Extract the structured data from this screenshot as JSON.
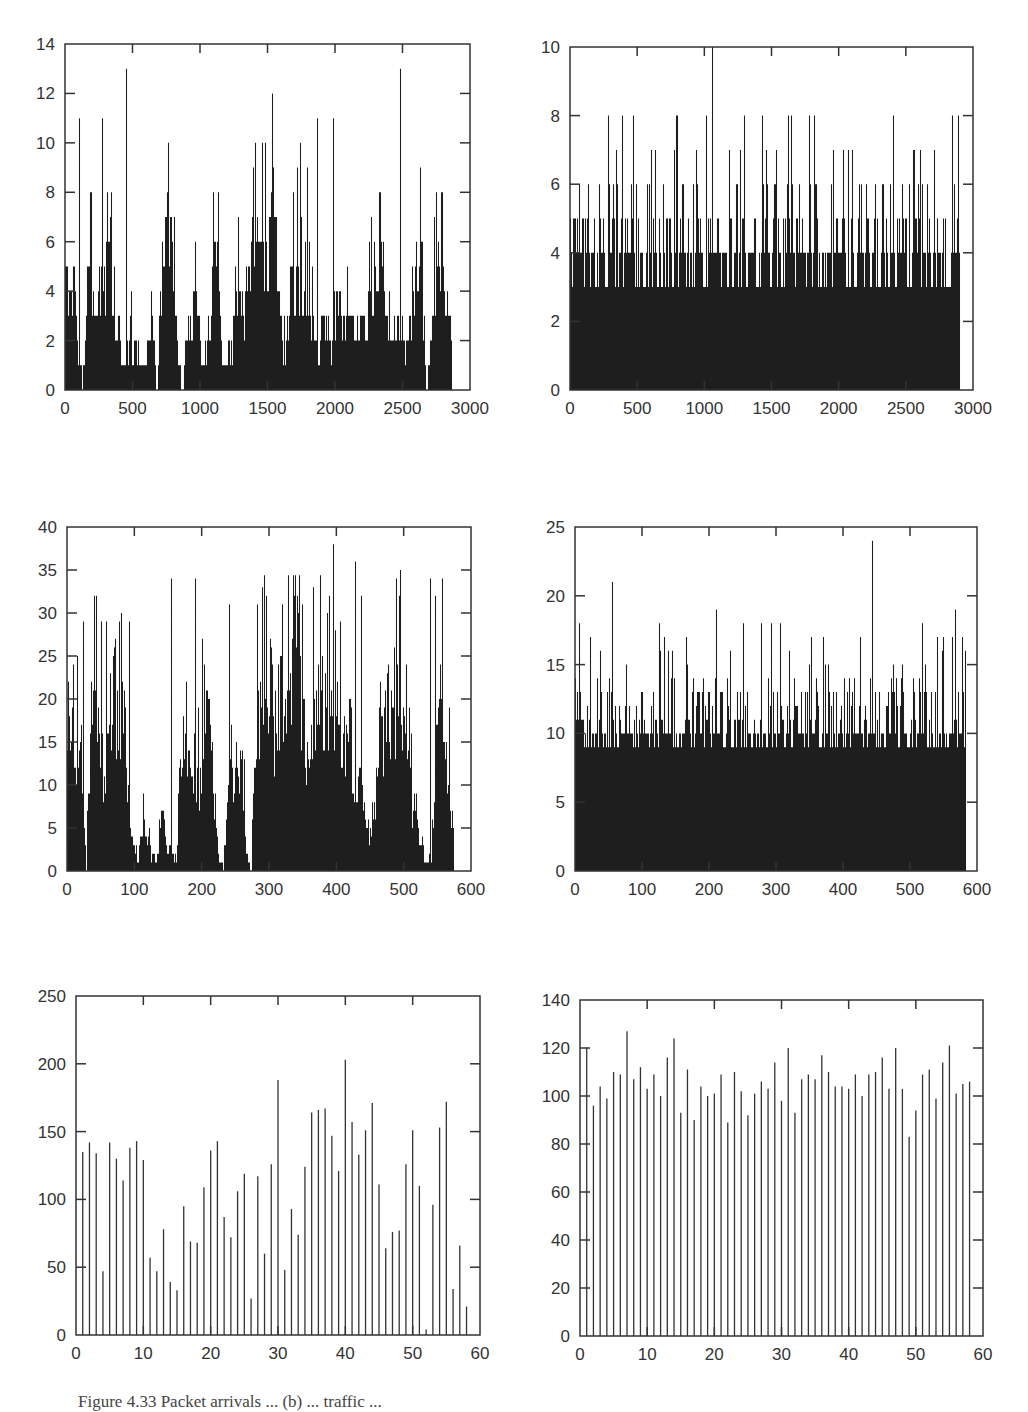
{
  "figure": {
    "caption": "Figure 4.33  Packet arrivals ... (b) ... traffic ...",
    "panels_layout": "3 rows x 2 columns"
  },
  "chart_data": [
    {
      "id": "top-left",
      "type": "bar",
      "frame": {
        "x0": 65,
        "x1": 470,
        "y0": 44,
        "y1": 390
      },
      "xlim": [
        0,
        3000
      ],
      "ylim": [
        0,
        14
      ],
      "xticks": [
        "0",
        "500",
        "1000",
        "1500",
        "2000",
        "2500",
        "3000"
      ],
      "yticks": [
        "0",
        "2",
        "4",
        "6",
        "8",
        "10",
        "12",
        "14"
      ],
      "xtick_values": [
        0,
        500,
        1000,
        1500,
        2000,
        2500,
        3000
      ],
      "ytick_values": [
        0,
        2,
        4,
        6,
        8,
        10,
        12,
        14
      ],
      "grid": false,
      "description": "Bursty packet-arrival counts per time bin, ~2870 bins, values 0-13",
      "n_bins": 2870,
      "envelope": [
        5,
        5,
        5,
        2,
        0,
        5,
        5,
        3,
        5,
        5,
        8,
        3,
        3,
        1,
        1,
        3,
        2,
        1,
        1,
        2,
        4,
        0,
        5,
        7,
        7,
        5,
        1,
        0,
        3,
        3,
        4,
        3,
        1,
        3,
        5,
        6,
        2,
        1,
        2,
        3,
        5,
        4,
        5,
        6,
        7,
        9,
        6,
        7,
        9,
        5,
        2,
        2,
        5,
        5,
        5,
        4,
        4,
        3,
        2,
        3,
        3,
        2,
        4,
        4,
        3,
        3,
        3,
        2,
        3,
        3,
        4,
        5,
        5,
        6,
        3,
        2,
        3,
        3,
        2,
        2,
        5,
        6,
        6,
        0,
        2,
        5,
        5,
        5,
        4,
        3
      ],
      "peaks": [
        [
          100,
          11
        ],
        [
          275,
          11
        ],
        [
          455,
          13
        ],
        [
          760,
          10
        ],
        [
          1410,
          10
        ],
        [
          1460,
          10
        ],
        [
          1480,
          10
        ],
        [
          1870,
          11
        ],
        [
          1985,
          11
        ],
        [
          2485,
          13
        ],
        [
          1740,
          10
        ],
        [
          1720,
          9
        ],
        [
          1790,
          9
        ]
      ],
      "max": 13,
      "min": 0
    },
    {
      "id": "top-right",
      "type": "bar",
      "frame": {
        "x0": 570,
        "x1": 973,
        "y0": 47,
        "y1": 390
      },
      "xlim": [
        0,
        3000
      ],
      "ylim": [
        0,
        10
      ],
      "xticks": [
        "0",
        "500",
        "1000",
        "1500",
        "2000",
        "2500",
        "3000"
      ],
      "yticks": [
        "0",
        "2",
        "4",
        "6",
        "8",
        "10"
      ],
      "xtick_values": [
        0,
        500,
        1000,
        1500,
        2000,
        2500,
        3000
      ],
      "ytick_values": [
        0,
        2,
        4,
        6,
        8,
        10
      ],
      "grid": false,
      "description": "Smooth (Poisson-like) packet-arrival counts, ~2900 bins, baseline 3-4, peaks up to 10",
      "n_bins": 2900,
      "base_levels": [
        3,
        4,
        5
      ],
      "peaks": [
        [
          1060,
          10
        ],
        [
          280,
          8
        ],
        [
          390,
          8
        ],
        [
          1780,
          8
        ],
        [
          1820,
          8
        ],
        [
          2890,
          8
        ],
        [
          775,
          7
        ],
        [
          1180,
          7
        ],
        [
          1460,
          7
        ],
        [
          1960,
          7
        ],
        [
          2030,
          7
        ],
        [
          2070,
          7
        ],
        [
          2100,
          7
        ],
        [
          2560,
          7
        ],
        [
          2710,
          7
        ]
      ],
      "max": 10,
      "min": 0
    },
    {
      "id": "middle-left",
      "type": "bar",
      "frame": {
        "x0": 67,
        "x1": 471,
        "y0": 527,
        "y1": 871
      },
      "xlim": [
        0,
        600
      ],
      "ylim": [
        0,
        40
      ],
      "xticks": [
        "0",
        "100",
        "200",
        "300",
        "400",
        "500",
        "600"
      ],
      "yticks": [
        "0",
        "5",
        "10",
        "15",
        "20",
        "25",
        "30",
        "35",
        "40"
      ],
      "xtick_values": [
        0,
        100,
        200,
        300,
        400,
        500,
        600
      ],
      "ytick_values": [
        0,
        5,
        10,
        15,
        20,
        25,
        30,
        35,
        40
      ],
      "grid": false,
      "description": "Bursty counts aggregated at coarser time scale, ~575 bins, values 0-38",
      "n_bins": 575,
      "envelope": [
        18,
        22,
        17,
        15,
        0,
        20,
        22,
        18,
        12,
        22,
        25,
        19,
        21,
        8,
        4,
        2,
        6,
        4,
        2,
        1,
        10,
        3,
        3,
        0,
        18,
        20,
        17,
        15,
        12,
        22,
        22,
        12,
        2,
        0,
        10,
        12,
        14,
        15,
        2,
        0,
        20,
        22,
        24,
        25,
        18,
        23,
        20,
        26,
        25,
        30,
        18,
        15,
        18,
        22,
        24,
        20,
        22,
        25,
        20,
        15,
        20,
        10,
        12,
        10,
        5,
        6,
        20,
        18,
        21,
        24,
        22,
        20,
        15,
        10,
        6,
        4,
        1,
        0,
        15,
        25,
        20,
        12,
        3
      ],
      "peaks": [
        [
          24,
          29
        ],
        [
          51,
          29
        ],
        [
          58,
          29
        ],
        [
          92,
          29
        ],
        [
          154,
          34
        ],
        [
          190,
          34
        ],
        [
          240,
          31
        ],
        [
          290,
          33
        ],
        [
          295,
          32
        ],
        [
          320,
          31
        ],
        [
          337,
          32
        ],
        [
          365,
          33
        ],
        [
          395,
          38
        ],
        [
          405,
          29
        ],
        [
          428,
          36
        ],
        [
          437,
          32
        ],
        [
          495,
          35
        ],
        [
          539,
          34
        ],
        [
          546,
          32
        ]
      ],
      "max": 38,
      "min": 0
    },
    {
      "id": "middle-right",
      "type": "bar",
      "frame": {
        "x0": 575,
        "x1": 977,
        "y0": 527,
        "y1": 871
      },
      "xlim": [
        0,
        600
      ],
      "ylim": [
        0,
        25
      ],
      "xticks": [
        "0",
        "100",
        "200",
        "300",
        "400",
        "500",
        "600"
      ],
      "yticks": [
        "0",
        "5",
        "10",
        "15",
        "20",
        "25"
      ],
      "xtick_values": [
        0,
        100,
        200,
        300,
        400,
        500,
        600
      ],
      "ytick_values": [
        0,
        5,
        10,
        15,
        20,
        25
      ],
      "grid": false,
      "description": "Smooth counts at coarser time scale, ~583 bins, baseline 9-12, peaks up to 24",
      "n_bins": 583,
      "base_levels": [
        9,
        10,
        11,
        12,
        13
      ],
      "peaks": [
        [
          444,
          24
        ],
        [
          55,
          21
        ],
        [
          210,
          19
        ],
        [
          567,
          19
        ],
        [
          6,
          18
        ],
        [
          125,
          18
        ],
        [
          250,
          18
        ],
        [
          277,
          18
        ],
        [
          293,
          18
        ],
        [
          306,
          18
        ],
        [
          518,
          18
        ],
        [
          22,
          17
        ],
        [
          133,
          17
        ],
        [
          165,
          17
        ],
        [
          352,
          17
        ],
        [
          370,
          17
        ],
        [
          426,
          17
        ],
        [
          540,
          17
        ],
        [
          549,
          17
        ],
        [
          562,
          17
        ],
        [
          578,
          17
        ]
      ],
      "max": 24,
      "min": 0
    },
    {
      "id": "bottom-left",
      "type": "bar",
      "frame": {
        "x0": 76,
        "x1": 480,
        "y0": 996,
        "y1": 1335
      },
      "xlim": [
        0,
        60
      ],
      "ylim": [
        0,
        250
      ],
      "xticks": [
        "0",
        "10",
        "20",
        "30",
        "40",
        "50",
        "60"
      ],
      "yticks": [
        "0",
        "50",
        "100",
        "150",
        "200",
        "250"
      ],
      "xtick_values": [
        0,
        10,
        20,
        30,
        40,
        50,
        60
      ],
      "ytick_values": [
        0,
        50,
        100,
        150,
        200,
        250
      ],
      "grid": false,
      "x": [
        1,
        2,
        3,
        4,
        5,
        6,
        7,
        8,
        9,
        10,
        11,
        12,
        13,
        14,
        15,
        16,
        17,
        18,
        19,
        20,
        21,
        22,
        23,
        24,
        25,
        26,
        27,
        28,
        29,
        30,
        31,
        32,
        33,
        34,
        35,
        36,
        37,
        38,
        39,
        40,
        41,
        42,
        43,
        44,
        45,
        46,
        47,
        48,
        49,
        50,
        51,
        52,
        53,
        54,
        55,
        56,
        57,
        58
      ],
      "values": [
        135,
        142,
        134,
        47,
        142,
        130,
        114,
        138,
        143,
        129,
        57,
        47,
        78,
        39,
        33,
        95,
        69,
        68,
        109,
        136,
        143,
        87,
        72,
        106,
        119,
        27,
        117,
        60,
        126,
        188,
        48,
        93,
        74,
        124,
        164,
        166,
        167,
        147,
        121,
        203,
        157,
        133,
        151,
        171,
        111,
        64,
        76,
        77,
        126,
        151,
        110,
        4,
        96,
        153,
        172,
        34,
        66,
        21
      ],
      "max": 203
    },
    {
      "id": "bottom-right",
      "type": "bar",
      "frame": {
        "x0": 580,
        "x1": 983,
        "y0": 1000,
        "y1": 1336
      },
      "xlim": [
        0,
        60
      ],
      "ylim": [
        0,
        140
      ],
      "xticks": [
        "0",
        "10",
        "20",
        "30",
        "40",
        "50",
        "60"
      ],
      "yticks": [
        "0",
        "20",
        "40",
        "60",
        "80",
        "100",
        "120",
        "140"
      ],
      "xtick_values": [
        0,
        10,
        20,
        30,
        40,
        50,
        60
      ],
      "ytick_values": [
        0,
        20,
        40,
        60,
        80,
        100,
        120,
        140
      ],
      "grid": false,
      "x": [
        1,
        2,
        3,
        4,
        5,
        6,
        7,
        8,
        9,
        10,
        11,
        12,
        13,
        14,
        15,
        16,
        17,
        18,
        19,
        20,
        21,
        22,
        23,
        24,
        25,
        26,
        27,
        28,
        29,
        30,
        31,
        32,
        33,
        34,
        35,
        36,
        37,
        38,
        39,
        40,
        41,
        42,
        43,
        44,
        45,
        46,
        47,
        48,
        49,
        50,
        51,
        52,
        53,
        54,
        55,
        56,
        57,
        58
      ],
      "values": [
        120,
        96,
        104,
        99,
        110,
        109,
        127,
        107,
        112,
        103,
        109,
        100,
        116,
        124,
        93,
        111,
        90,
        104,
        100,
        101,
        109,
        89,
        110,
        102,
        92,
        101,
        106,
        103,
        114,
        98,
        120,
        93,
        107,
        109,
        107,
        117,
        110,
        104,
        104,
        103,
        109,
        100,
        109,
        110,
        116,
        103,
        120,
        103,
        83,
        94,
        109,
        111,
        99,
        114,
        121,
        101,
        105,
        106
      ],
      "max": 127
    }
  ]
}
